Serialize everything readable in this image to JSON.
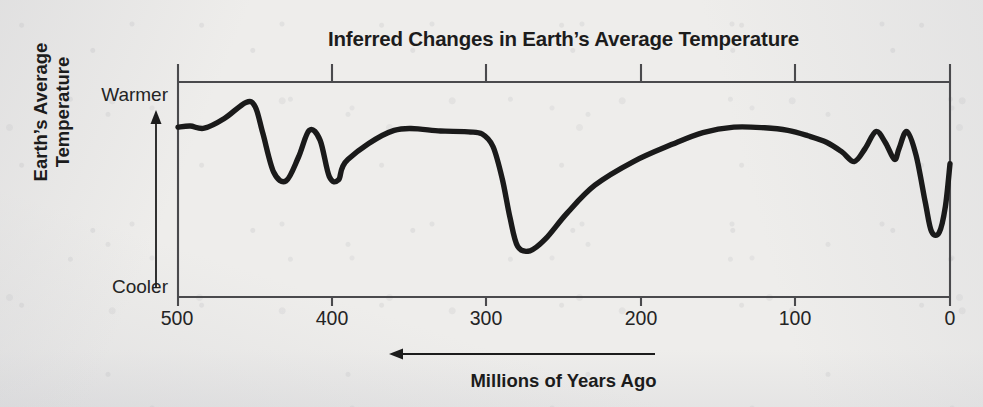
{
  "chart_data": {
    "type": "line",
    "title": "Inferred Changes in Earth’s Average Temperature",
    "xlabel": "Millions of Years Ago",
    "ylabel": "Earth’s Average Temperature",
    "ylabel_line1": "Earth’s Average",
    "ylabel_line2": "Temperature",
    "y_axis_top_label": "Warmer",
    "y_axis_bottom_label": "Cooler",
    "x_tick_labels": [
      "500",
      "400",
      "300",
      "200",
      "100",
      "0"
    ],
    "x_ticks": [
      500,
      400,
      300,
      200,
      100,
      0
    ],
    "xlim": [
      500,
      0
    ],
    "x_direction_note": "axis decreases left to right; arrow points left",
    "ylim": [
      0,
      1
    ],
    "y_tick_labels": [],
    "grid": false,
    "legend": false,
    "series": [
      {
        "name": "Inferred Earth average temperature",
        "color": "#1a1a1a",
        "x": [
          500,
          492,
          483,
          470,
          456,
          450,
          445,
          438,
          430,
          422,
          415,
          408,
          402,
          396,
          390,
          360,
          330,
          312,
          303,
          296,
          290,
          285,
          280,
          272,
          262,
          248,
          230,
          205,
          180,
          160,
          140,
          120,
          105,
          92,
          80,
          70,
          62,
          55,
          48,
          42,
          36,
          33,
          28,
          22,
          16,
          12,
          7,
          3,
          0
        ],
        "y": [
          0.79,
          0.795,
          0.785,
          0.83,
          0.905,
          0.885,
          0.76,
          0.58,
          0.54,
          0.65,
          0.775,
          0.73,
          0.56,
          0.545,
          0.64,
          0.775,
          0.772,
          0.768,
          0.758,
          0.7,
          0.55,
          0.37,
          0.235,
          0.215,
          0.27,
          0.39,
          0.52,
          0.63,
          0.71,
          0.765,
          0.79,
          0.787,
          0.775,
          0.75,
          0.72,
          0.675,
          0.63,
          0.69,
          0.77,
          0.72,
          0.64,
          0.69,
          0.77,
          0.66,
          0.44,
          0.305,
          0.3,
          0.42,
          0.62
        ]
      }
    ]
  },
  "icons": {
    "y_arrow": "arrow-up-icon",
    "x_arrow": "arrow-left-icon"
  },
  "colors": {
    "curve": "#1a1a1a",
    "axis": "#4a4a4d",
    "text": "#1c1c1c",
    "background": "#eeedeb"
  }
}
